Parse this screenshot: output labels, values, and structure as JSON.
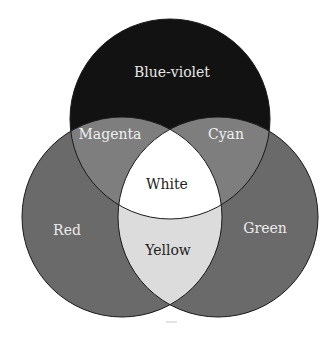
{
  "diagram": {
    "type": "venn",
    "circles": [
      {
        "name": "Blue-violet",
        "cx": 170,
        "cy": 119,
        "r": 100,
        "color": "#121212"
      },
      {
        "name": "Red",
        "cx": 122,
        "cy": 217,
        "r": 100,
        "color": "#6a6a6a"
      },
      {
        "name": "Green",
        "cx": 218,
        "cy": 217,
        "r": 100,
        "color": "#6a6a6a"
      }
    ],
    "regions": {
      "blue_violet": {
        "label": "Blue-violet",
        "color": "#121212",
        "text_color": "#e6e6e6"
      },
      "red": {
        "label": "Red",
        "color": "#6a6a6a",
        "text_color": "#ececec"
      },
      "green": {
        "label": "Green",
        "color": "#6a6a6a",
        "text_color": "#ececec"
      },
      "magenta": {
        "label": "Magenta",
        "color": "#7e7e7e",
        "text_color": "#f0f0f0"
      },
      "cyan": {
        "label": "Cyan",
        "color": "#7e7e7e",
        "text_color": "#f0f0f0"
      },
      "yellow": {
        "label": "Yellow",
        "color": "#dcdcdc",
        "text_color": "#222222"
      },
      "white": {
        "label": "White",
        "color": "#ffffff",
        "text_color": "#222222"
      }
    },
    "outline_color": "#1a1a1a"
  }
}
